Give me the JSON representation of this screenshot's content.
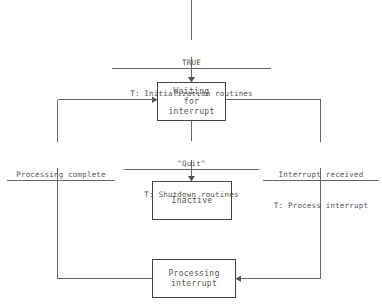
{
  "diagram": {
    "type": "state-transition-diagram",
    "states": [
      {
        "id": "waiting",
        "lines": [
          "Waiting",
          "for",
          "interrupt"
        ]
      },
      {
        "id": "inactive",
        "lines": [
          "Inactive"
        ]
      },
      {
        "id": "processing",
        "lines": [
          "Processing",
          "interrupt"
        ]
      }
    ],
    "transitions": [
      {
        "id": "initial",
        "guard": "TRUE",
        "action": "T: Initialization routines"
      },
      {
        "id": "quit",
        "guard": "\"Quit\"",
        "action": "T: Shutdown routines"
      },
      {
        "id": "interrupt-received",
        "guard": "Interrupt received",
        "action": "T: Process interrupt"
      },
      {
        "id": "processing-complete",
        "guard": "Processing complete",
        "action": ""
      }
    ]
  }
}
